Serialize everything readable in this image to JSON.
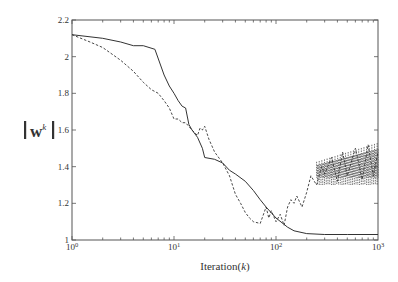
{
  "chart_data": {
    "type": "line",
    "title": "",
    "xlabel": "Iteration(k)",
    "xlabel_text": "Iteration(",
    "xlabel_var": "k",
    "xlabel_close": ")",
    "ylabel": "||w^k||",
    "ylabel_base": "w",
    "ylabel_sup": "k",
    "xscale": "log",
    "xlim": [
      1,
      1000
    ],
    "ylim": [
      1.0,
      2.2
    ],
    "grid": false,
    "legend": null,
    "x_ticks": [
      {
        "value": 1,
        "base": "10",
        "exp": "0"
      },
      {
        "value": 10,
        "base": "10",
        "exp": "1"
      },
      {
        "value": 100,
        "base": "10",
        "exp": "2"
      },
      {
        "value": 1000,
        "base": "10",
        "exp": "3"
      }
    ],
    "y_ticks": [
      {
        "value": 1.0,
        "label": "1"
      },
      {
        "value": 1.2,
        "label": "1.2"
      },
      {
        "value": 1.4,
        "label": "1.4"
      },
      {
        "value": 1.6,
        "label": "1.6"
      },
      {
        "value": 1.8,
        "label": "1.8"
      },
      {
        "value": 2.0,
        "label": "2"
      },
      {
        "value": 2.2,
        "label": "2.2"
      }
    ],
    "series": [
      {
        "name": "solid",
        "style": "solid",
        "color": "#333333",
        "x": [
          1,
          2,
          3,
          4,
          5,
          6.5,
          8,
          9,
          10,
          11,
          12,
          13,
          14,
          15,
          17,
          19,
          20,
          25,
          30,
          35,
          40,
          50,
          60,
          70,
          80,
          100,
          130,
          150,
          200,
          300,
          500,
          1000
        ],
        "y": [
          2.12,
          2.1,
          2.08,
          2.06,
          2.06,
          2.04,
          1.9,
          1.84,
          1.8,
          1.76,
          1.73,
          1.72,
          1.63,
          1.6,
          1.56,
          1.5,
          1.45,
          1.44,
          1.42,
          1.38,
          1.36,
          1.32,
          1.27,
          1.22,
          1.18,
          1.12,
          1.07,
          1.05,
          1.035,
          1.03,
          1.03,
          1.03
        ]
      },
      {
        "name": "dashed",
        "style": "dashed",
        "color": "#333333",
        "x": [
          1,
          1.5,
          2,
          3,
          4,
          5,
          6,
          7,
          8,
          9,
          10,
          11,
          12,
          13,
          15,
          17,
          18,
          19,
          20,
          22,
          25,
          30,
          35,
          40,
          45,
          50,
          55,
          60,
          70,
          80,
          85,
          90,
          100,
          110,
          120,
          130,
          140,
          150,
          160,
          180,
          200,
          220,
          250,
          280,
          300,
          350,
          400,
          450,
          500,
          600,
          700,
          800,
          900,
          1000
        ],
        "y": [
          2.12,
          2.08,
          2.05,
          1.98,
          1.92,
          1.86,
          1.82,
          1.8,
          1.76,
          1.72,
          1.66,
          1.66,
          1.64,
          1.64,
          1.6,
          1.57,
          1.61,
          1.6,
          1.62,
          1.55,
          1.48,
          1.42,
          1.35,
          1.25,
          1.2,
          1.15,
          1.12,
          1.1,
          1.09,
          1.18,
          1.12,
          1.16,
          1.1,
          1.14,
          1.08,
          1.18,
          1.22,
          1.2,
          1.24,
          1.18,
          1.26,
          1.35,
          1.3,
          1.4,
          1.36,
          1.45,
          1.32,
          1.48,
          1.35,
          1.5,
          1.33,
          1.52,
          1.35,
          1.48
        ]
      }
    ],
    "oscillation_band": {
      "x_range": [
        250,
        1000
      ],
      "y_range": [
        1.3,
        1.53
      ]
    }
  }
}
